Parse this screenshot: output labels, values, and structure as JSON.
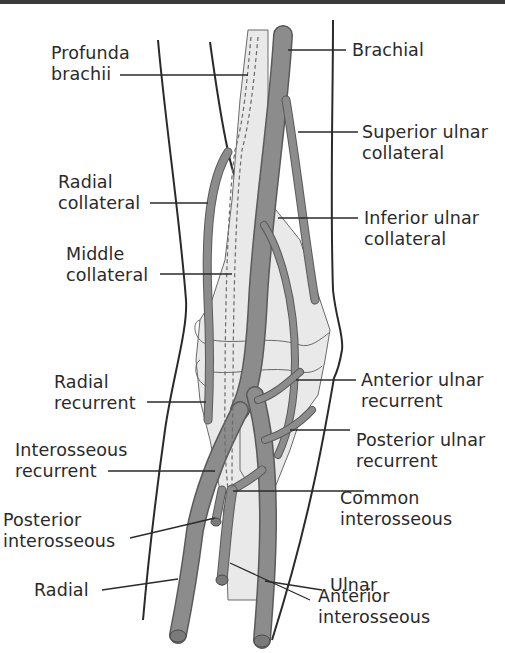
{
  "diagram": {
    "colors": {
      "vessel_fill": "#8c8c8c",
      "vessel_outline": "#5a5a5a",
      "bone_fill": "#e9e9e9",
      "outline": "#2a2a2a",
      "text": "#2a2a2a",
      "background": "#ffffff"
    },
    "labels": {
      "profunda_brachii": "Profunda\nbrachii",
      "brachial": "Brachial",
      "superior_ulnar_collateral": "Superior ulnar\ncollateral",
      "radial_collateral": "Radial\ncollateral",
      "inferior_ulnar_collateral": "Inferior ulnar\ncollateral",
      "middle_collateral": "Middle\ncollateral",
      "radial_recurrent": "Radial\nrecurrent",
      "anterior_ulnar_recurrent": "Anterior ulnar\nrecurrent",
      "interosseous_recurrent": "Interosseous\nrecurrent",
      "posterior_ulnar_recurrent": "Posterior ulnar\nrecurrent",
      "common_interosseous": "Common\ninterosseous",
      "posterior_interosseous": "Posterior\ninterosseous",
      "ulnar": "Ulnar",
      "radial": "Radial",
      "anterior_interosseous": "Anterior\ninterosseous"
    }
  }
}
